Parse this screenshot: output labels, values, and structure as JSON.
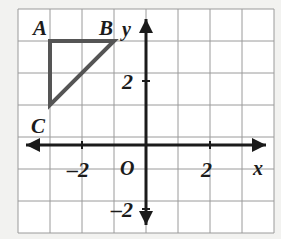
{
  "figure": {
    "background_color": "#f2f2f0",
    "plot_background_color": "#ffffff",
    "grid_color": "#9a9a9a",
    "axis_color": "#1b1b1b",
    "shape_color": "#555555",
    "axes": {
      "x_axis_label": "x",
      "y_axis_label": "y",
      "origin_label": "O",
      "x_ticks": [
        {
          "value": -2,
          "label": "–2"
        },
        {
          "value": 2,
          "label": "2"
        }
      ],
      "y_ticks": [
        {
          "value": 2,
          "label": "2"
        },
        {
          "value": -2,
          "label": "–2"
        }
      ],
      "xlim": [
        -4,
        4
      ],
      "ylim": [
        -3,
        4
      ],
      "grid": true,
      "grid_step": 1,
      "arrows": [
        "left",
        "right",
        "up",
        "down"
      ]
    },
    "points": [
      {
        "name": "A",
        "label": "A",
        "x": -3,
        "y": 3,
        "label_dx": -0.35,
        "label_dy": 0.95
      },
      {
        "name": "B",
        "label": "B",
        "x": -1,
        "y": 3,
        "label_dx": -0.3,
        "label_dy": 0.95
      },
      {
        "name": "C",
        "label": "C",
        "x": -3,
        "y": 1,
        "label_dx": -0.35,
        "label_dy": -0.3
      }
    ],
    "shape": {
      "type": "triangle",
      "vertices": [
        [
          -3,
          3
        ],
        [
          -1,
          3
        ],
        [
          -3,
          1
        ]
      ],
      "closed": true,
      "stroke_width": 4
    }
  }
}
